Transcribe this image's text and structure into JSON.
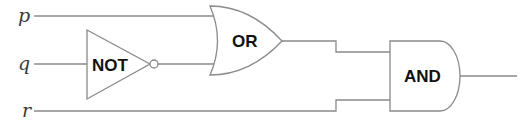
{
  "diagram": {
    "type": "logic-circuit",
    "inputs": [
      {
        "id": "p",
        "label": "p"
      },
      {
        "id": "q",
        "label": "q"
      },
      {
        "id": "r",
        "label": "r"
      }
    ],
    "gates": [
      {
        "id": "not",
        "label": "NOT",
        "inputs": [
          "q"
        ]
      },
      {
        "id": "or",
        "label": "OR",
        "inputs": [
          "p",
          "not"
        ]
      },
      {
        "id": "and",
        "label": "AND",
        "inputs": [
          "or",
          "r"
        ]
      }
    ],
    "colors": {
      "wire": "#8a8a8a",
      "gate_label": "#111111",
      "input_label": "#3a3a3a"
    }
  }
}
